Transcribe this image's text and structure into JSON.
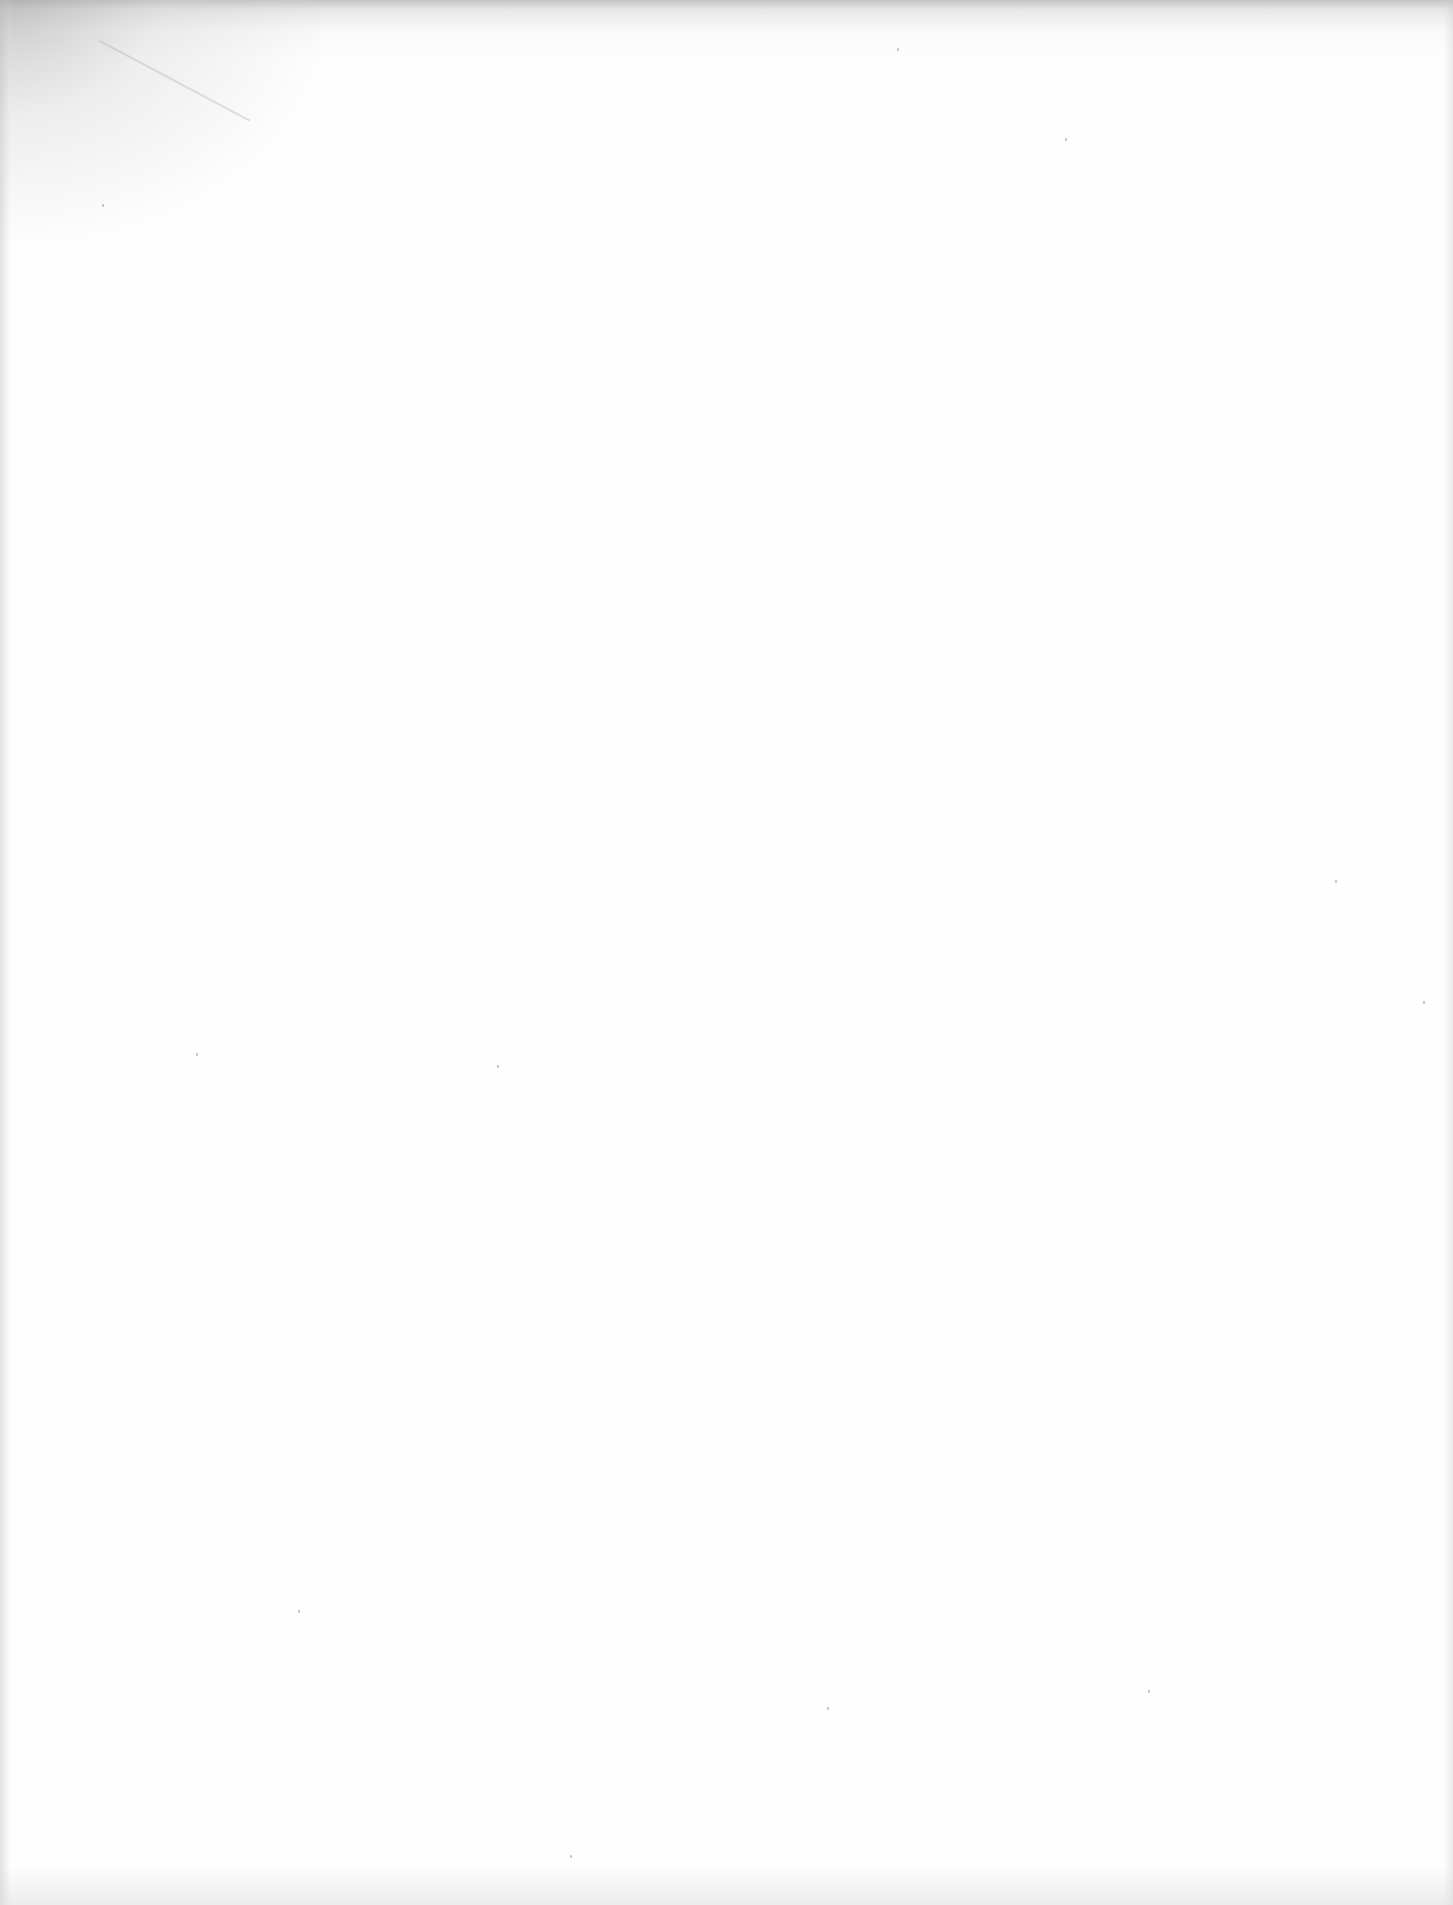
{
  "document": {
    "type": "scanned-page",
    "content": "",
    "visible_text": [],
    "background_color": "#fefefe",
    "edge_shading_color": "#a0a0a0"
  }
}
